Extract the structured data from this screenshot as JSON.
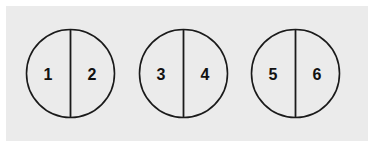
{
  "figure": {
    "background_color": "#ffffff",
    "panel_color": "#ebebeb",
    "stroke_color": "#1a1a1a",
    "label_color": "#111111",
    "circles": [
      {
        "name": "circle-1",
        "cx": 70.5,
        "cy": 73.5,
        "r": 44,
        "divider": "vertical",
        "left": {
          "label": "1",
          "x": 48,
          "y": 73.5
        },
        "right": {
          "label": "2",
          "x": 92,
          "y": 73.5
        }
      },
      {
        "name": "circle-2",
        "cx": 183.5,
        "cy": 73.5,
        "r": 44,
        "divider": "vertical",
        "left": {
          "label": "3",
          "x": 161,
          "y": 73.5
        },
        "right": {
          "label": "4",
          "x": 205,
          "y": 73.5
        }
      },
      {
        "name": "circle-3",
        "cx": 295.5,
        "cy": 73.5,
        "r": 44,
        "divider": "vertical",
        "left": {
          "label": "5",
          "x": 273,
          "y": 73.5
        },
        "right": {
          "label": "6",
          "x": 317,
          "y": 73.5
        }
      }
    ],
    "labels_in_order": [
      "1",
      "2",
      "3",
      "4",
      "5",
      "6"
    ]
  }
}
